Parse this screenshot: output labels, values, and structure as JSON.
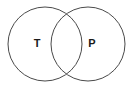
{
  "figure": {
    "name": "venn-diagram",
    "type": "two-set-venn-diagram",
    "background_color": "#ffffff",
    "width": 133,
    "height": 88
  },
  "style": {
    "stroke_color": "#4a4a4a",
    "stroke_width": 1,
    "fill": "none",
    "label_color": "#1a1a1a",
    "label_font_size": 11,
    "label_font_weight": "bold"
  },
  "sets": [
    {
      "id": "set-t",
      "label": "T",
      "label_x": 37,
      "label_y": 44,
      "circle": {
        "cx": 45,
        "cy": 44,
        "r": 37
      }
    },
    {
      "id": "set-p",
      "label": "P",
      "label_x": 92,
      "label_y": 44,
      "circle": {
        "cx": 88,
        "cy": 44,
        "r": 37
      }
    }
  ],
  "intersection": {
    "name": "overlap-region",
    "label": "",
    "upper_crossing": {
      "x": 66.5,
      "y": 13
    },
    "lower_crossing": {
      "x": 66.5,
      "y": 75
    }
  }
}
